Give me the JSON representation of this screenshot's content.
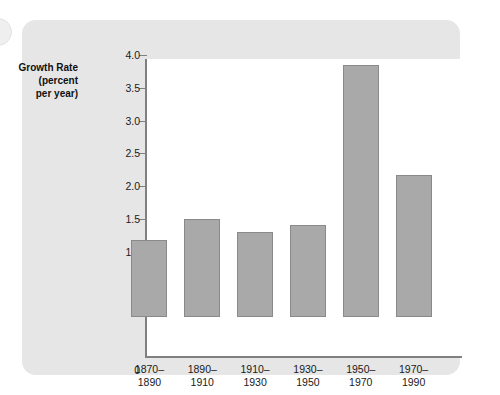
{
  "figure": {
    "background_color": "#e6e6e6",
    "plot_background_color": "#ffffff",
    "bar_color": "#a9a9a9",
    "bar_border_color": "#8a8a8a",
    "axis_color": "#808080"
  },
  "chart_data": {
    "type": "bar",
    "title": "",
    "subtitle": "",
    "xlabel": "",
    "ylabel": "Growth Rate\n(percent\nper year)",
    "categories": [
      "1870–\n1890",
      "1890–\n1910",
      "1910–\n1930",
      "1930–\n1950",
      "1950–\n1970",
      "1970–\n1990"
    ],
    "category_labels_flat": [
      "1870–1890",
      "1890–1910",
      "1910–1930",
      "1930–1950",
      "1950–1970",
      "1970–1990"
    ],
    "values": [
      1.17,
      1.5,
      1.3,
      1.4,
      3.85,
      2.17
    ],
    "ylim": [
      0,
      4.25
    ],
    "yticks": [
      1.0,
      1.5,
      2.0,
      2.5,
      3.0,
      3.5,
      4.0
    ],
    "ytick_labels": [
      "1.0",
      "1.5",
      "2.0",
      "2.5",
      "3.0",
      "3.5",
      "4.0"
    ],
    "origin_label": "0",
    "grid": false,
    "legend": false,
    "legend_position": "none"
  }
}
